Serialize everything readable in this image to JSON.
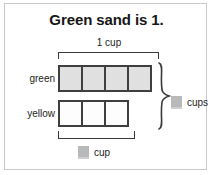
{
  "card": {
    "title": "Green sand is 1.",
    "top_bracket_label": "1 cup",
    "rows": [
      {
        "label": "green",
        "cells": 4,
        "fill": "#e0e0e0"
      },
      {
        "label": "yellow",
        "cells": 3,
        "fill": "#fdfdfd"
      }
    ],
    "answers": {
      "cups_label": "cups",
      "cup_label": "cup"
    },
    "colors": {
      "cell_border": "#3f3f3f",
      "bracket": "#3a3a3a",
      "answer_box": "#b9b9b9",
      "card_border": "#c9c9c9",
      "text": "#1d1d1d"
    }
  }
}
